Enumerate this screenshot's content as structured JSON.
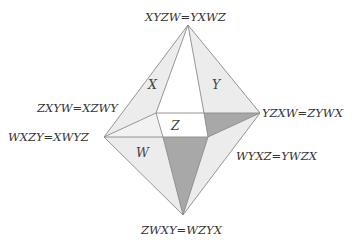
{
  "diagram": {
    "type": "octahedron-like polyhedron with labeled vertices and faces",
    "vertex_labels": {
      "top": "XYZW=YXWZ",
      "upper_left": "ZXYW=XZWY",
      "left": "WXZY=XWYZ",
      "right": "YZXW=ZYWX",
      "lower_right": "WYXZ=YWZX",
      "bottom": "ZWXY=WZYX"
    },
    "face_labels": {
      "x": "X",
      "y": "Y",
      "z": "Z",
      "w": "W"
    },
    "colors": {
      "light_face": "#ececec",
      "dark_face": "#a8a8a8",
      "edge": "#8a8a8a",
      "text": "#333333"
    }
  }
}
